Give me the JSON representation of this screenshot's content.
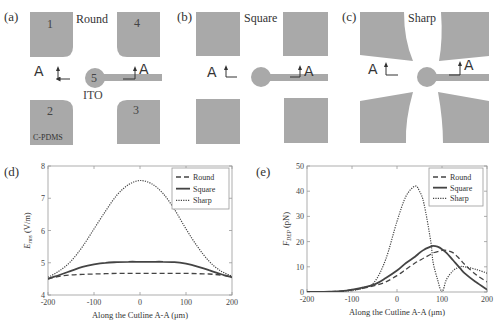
{
  "figure": {
    "panels": [
      {
        "id": "a",
        "label": "(a)",
        "title": "Round",
        "electrode_numbers": [
          "1",
          "4",
          "5",
          "2",
          "3"
        ],
        "center_label": "ITO",
        "pad_label": "C-PDMS",
        "cutline_label": "A"
      },
      {
        "id": "b",
        "label": "(b)",
        "title": "Square",
        "cutline_label": "A"
      },
      {
        "id": "c",
        "label": "(c)",
        "title": "Sharp",
        "cutline_label": "A"
      },
      {
        "id": "d",
        "label": "(d)"
      },
      {
        "id": "e",
        "label": "(e)"
      }
    ],
    "colors": {
      "pad": "#a9a9a9",
      "axis": "#888888",
      "curve": "#444444"
    }
  },
  "chart_data": [
    {
      "type": "line",
      "panel": "(d)",
      "title": "",
      "xlabel": "Along the Cutline A-A (μm)",
      "ylabel": "E_rms (V/m)",
      "ylabel_main": "E",
      "ylabel_sub": "rms",
      "ylabel_unit": "(V/m)",
      "xlim": [
        -200,
        200
      ],
      "ylim": [
        4,
        8
      ],
      "xticks": [
        "-200",
        "-100",
        "0",
        "100",
        "200"
      ],
      "yticks": [
        "4",
        "5",
        "6",
        "7",
        "8"
      ],
      "grid": false,
      "legend_position": "upper right",
      "x": [
        -200,
        -175,
        -150,
        -125,
        -100,
        -75,
        -50,
        -25,
        0,
        25,
        50,
        75,
        100,
        125,
        150,
        175,
        200
      ],
      "series": [
        {
          "name": "Round",
          "style": "dashed",
          "values": [
            4.5,
            4.58,
            4.62,
            4.64,
            4.65,
            4.66,
            4.67,
            4.67,
            4.67,
            4.67,
            4.67,
            4.67,
            4.67,
            4.66,
            4.65,
            4.62,
            4.55
          ]
        },
        {
          "name": "Square",
          "style": "solid",
          "values": [
            4.5,
            4.62,
            4.75,
            4.87,
            4.95,
            5.0,
            5.02,
            5.03,
            5.03,
            5.03,
            5.03,
            5.02,
            4.97,
            4.88,
            4.77,
            4.65,
            4.55
          ]
        },
        {
          "name": "Sharp",
          "style": "dotted",
          "values": [
            4.55,
            4.75,
            5.05,
            5.5,
            6.05,
            6.6,
            7.1,
            7.42,
            7.55,
            7.45,
            7.15,
            6.65,
            6.05,
            5.5,
            5.05,
            4.75,
            4.58
          ]
        }
      ]
    },
    {
      "type": "line",
      "panel": "(e)",
      "title": "",
      "xlabel": "Along the Cutline A-A (μm)",
      "ylabel": "F_DEP (pN)",
      "ylabel_main": "F",
      "ylabel_sub": "DEP",
      "ylabel_unit": "(pN)",
      "xlim": [
        -200,
        200
      ],
      "ylim": [
        0,
        50
      ],
      "xticks": [
        "-200",
        "-100",
        "0",
        "100",
        "200"
      ],
      "yticks": [
        "0",
        "10",
        "20",
        "30",
        "40",
        "50"
      ],
      "grid": false,
      "legend_position": "upper right",
      "x": [
        -200,
        -175,
        -150,
        -125,
        -100,
        -75,
        -50,
        -25,
        0,
        20,
        40,
        50,
        60,
        75,
        80,
        90,
        100,
        110,
        125,
        140,
        150,
        175,
        200
      ],
      "series": [
        {
          "name": "Round",
          "style": "dashed",
          "values": [
            0,
            0,
            0.1,
            0.3,
            0.8,
            1.5,
            2.5,
            4,
            6.5,
            9,
            11.5,
            12.5,
            13.5,
            15,
            15.5,
            16,
            16.5,
            16.5,
            15.5,
            13,
            11,
            7,
            4
          ]
        },
        {
          "name": "Square",
          "style": "solid",
          "values": [
            0,
            0,
            0.1,
            0.3,
            0.9,
            1.8,
            3,
            5.5,
            8.5,
            11.5,
            14,
            15.5,
            16.8,
            18,
            18.3,
            18,
            17,
            15.5,
            12.5,
            9.5,
            7.5,
            4,
            1
          ]
        },
        {
          "name": "Sharp",
          "style": "dotted",
          "values": [
            0,
            0,
            0.1,
            0.2,
            0.6,
            1.5,
            4,
            13,
            28,
            38,
            42,
            40,
            35,
            20,
            12,
            5,
            0,
            5,
            8.5,
            10,
            10,
            9,
            7.5
          ]
        }
      ]
    }
  ]
}
